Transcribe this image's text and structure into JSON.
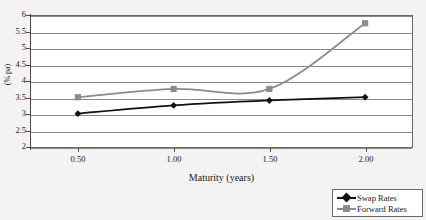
{
  "chart_data": {
    "type": "line",
    "title": "",
    "xlabel": "Maturity (years)",
    "ylabel": "(% pa)",
    "x": [
      0.5,
      1.0,
      1.5,
      2.0
    ],
    "xtick_labels": [
      "0.50",
      "1.00",
      "1.50",
      "2.00"
    ],
    "xlim": [
      0.25,
      2.25
    ],
    "ylim": [
      2,
      6
    ],
    "ytick_labels": [
      "2",
      "2.5",
      "3",
      "3.5",
      "4",
      "4.5",
      "5",
      "5.5",
      "6"
    ],
    "ytick_values": [
      2,
      2.5,
      3,
      3.5,
      4,
      4.5,
      5,
      5.5,
      6
    ],
    "grid": "horizontal",
    "legend_position": "bottom-right-outside",
    "smoothed": true,
    "series": [
      {
        "name": "Swap Rates",
        "values": [
          3.0,
          3.25,
          3.4,
          3.5
        ],
        "color": "#111111",
        "marker": "diamond"
      },
      {
        "name": "Forward Rates",
        "values": [
          3.5,
          3.75,
          3.75,
          5.75
        ],
        "color": "#8c8c8c",
        "marker": "square"
      }
    ]
  },
  "legend": {
    "items": [
      {
        "label": "Swap Rates",
        "color": "#111111",
        "marker": "diamond"
      },
      {
        "label": "Forward Rates",
        "color": "#8c8c8c",
        "marker": "square"
      }
    ]
  },
  "colors": {
    "background": "#f3f3f3",
    "plot_background": "#ffffff",
    "gridline": "#8a8a8a",
    "axis": "#4a4a4a",
    "border": "#6b6b6b",
    "text": "#1c1c1c",
    "swap_rates": "#111111",
    "forward_rates": "#8c8c8c"
  }
}
